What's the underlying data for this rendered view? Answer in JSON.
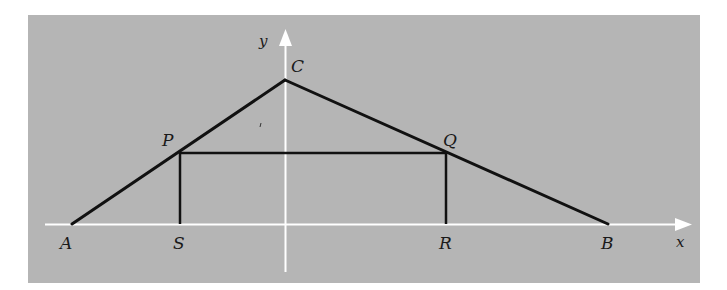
{
  "figure": {
    "background": "#b5b5b5",
    "axis_color": "#ffffff",
    "line_color": "#111111",
    "axes": {
      "x_label": "x",
      "y_label": "y"
    },
    "points": {
      "A": "A",
      "B": "B",
      "C": "C",
      "P": "P",
      "Q": "Q",
      "R": "R",
      "S": "S"
    }
  }
}
